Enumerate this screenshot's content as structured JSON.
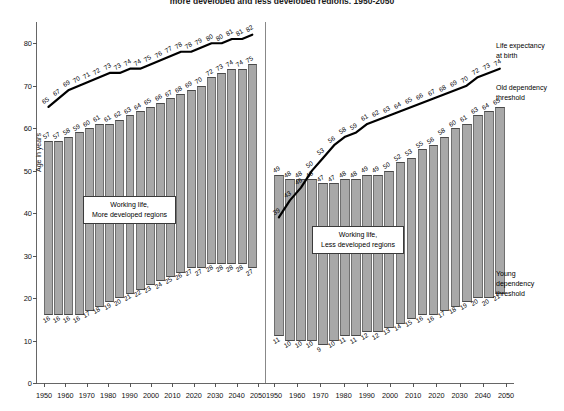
{
  "title": "more developed and less developed regions, 1950-2050",
  "axes": {
    "ylabel": "Age in years",
    "yticks": [
      0,
      10,
      20,
      30,
      40,
      50,
      60,
      70,
      80
    ],
    "ylim": [
      0,
      85
    ],
    "xticks": [
      "1950",
      "1960",
      "1970",
      "1980",
      "1990",
      "2000",
      "2010",
      "2020",
      "2030",
      "2040",
      "2050"
    ],
    "xlim": [
      1950,
      2050
    ]
  },
  "captions": {
    "left_box_line1": "Working life,",
    "left_box_line2": "More developed regions",
    "right_box_line1": "Working life,",
    "right_box_line2": "Less developed regions"
  },
  "annotations": {
    "life_expectancy_line1": "Life expectancy",
    "life_expectancy_line2": "at birth",
    "old_dependency_line1": "Old dependency",
    "old_dependency_line2": "threshold",
    "young_dependency_line1": "Young",
    "young_dependency_line2": "dependency",
    "young_dependency_line3": "threshold"
  },
  "chart_data": {
    "type": "bar",
    "title": "more developed and less developed regions, 1950-2050",
    "xlabel": "",
    "ylabel": "Age in years",
    "ylim": [
      0,
      85
    ],
    "grid": false,
    "legend": "right-side text annotations",
    "panels": [
      {
        "name": "More developed regions",
        "x": [
          1950,
          1955,
          1960,
          1965,
          1970,
          1975,
          1980,
          1985,
          1990,
          1995,
          2000,
          2005,
          2010,
          2015,
          2020,
          2025,
          2030,
          2035,
          2040,
          2045,
          2050
        ],
        "series": [
          {
            "name": "Old dependency threshold (top of working-life bar)",
            "values": [
              57,
              57,
              58,
              59,
              60,
              61,
              61,
              62,
              63,
              64,
              65,
              66,
              67,
              68,
              69,
              70,
              72,
              73,
              74,
              74,
              75
            ]
          },
          {
            "name": "Young dependency threshold (bottom of working-life bar)",
            "values": [
              16,
              16,
              16,
              16,
              17,
              18,
              19,
              20,
              21,
              22,
              23,
              24,
              25,
              26,
              27,
              27,
              28,
              28,
              28,
              28,
              27
            ]
          },
          {
            "name": "Life expectancy at birth",
            "type": "line",
            "values": [
              65,
              67,
              69,
              70,
              71,
              72,
              73,
              73,
              74,
              74,
              75,
              76,
              77,
              78,
              78,
              79,
              80,
              80,
              81,
              81,
              82
            ]
          }
        ]
      },
      {
        "name": "Less developed regions",
        "x": [
          1950,
          1955,
          1960,
          1965,
          1970,
          1975,
          1980,
          1985,
          1990,
          1995,
          2000,
          2005,
          2010,
          2015,
          2020,
          2025,
          2030,
          2035,
          2040,
          2045,
          2050
        ],
        "series": [
          {
            "name": "Old dependency threshold (top of working-life bar)",
            "values": [
              49,
              48,
              48,
              48,
              47,
              47,
              48,
              48,
              49,
              49,
              50,
              52,
              53,
              55,
              56,
              58,
              60,
              61,
              63,
              64,
              65
            ]
          },
          {
            "name": "Young dependency threshold (bottom of working-life bar)",
            "values": [
              11,
              10,
              10,
              10,
              9,
              10,
              11,
              11,
              12,
              12,
              13,
              14,
              15,
              16,
              16,
              17,
              18,
              19,
              20,
              20,
              21
            ]
          },
          {
            "name": "Life expectancy at birth",
            "type": "line",
            "values": [
              39,
              43,
              46,
              50,
              53,
              56,
              58,
              59,
              61,
              62,
              63,
              64,
              65,
              66,
              67,
              68,
              69,
              70,
              72,
              73,
              74
            ]
          }
        ]
      }
    ]
  }
}
